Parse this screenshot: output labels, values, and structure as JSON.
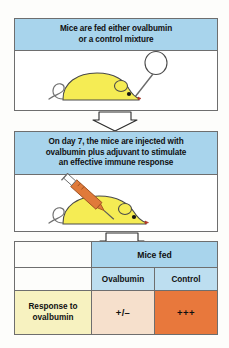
{
  "figure": {
    "colors": {
      "caption_blue": "#a8d4ec",
      "header_blue": "#bddef0",
      "row_label_yellow": "#f7f2c0",
      "treated_peach": "#f6e0cc",
      "control_orange": "#e8783c",
      "mouse_yellow": "#f5ec54",
      "syringe_orange": "#e07a3a",
      "outline": "#6e6e6e"
    }
  },
  "steps": [
    {
      "caption": "Mice are fed either ovalbumin or a control mixture",
      "caption_line1": "Mice are fed either ovalbumin",
      "caption_line2": "or a control mixture",
      "illustration": "mouse-being-fed-with-dropper"
    },
    {
      "caption": "On day 7, the mice are injected with ovalbumin plus adjuvant to stimulate an effective immune response",
      "caption_line1": "On day 7, the mice are injected with",
      "caption_line2": "ovalbumin plus adjuvant to stimulate",
      "caption_line3": "an effective immune response",
      "illustration": "mouse-being-injected-with-syringe"
    }
  ],
  "arrows": [
    {
      "name": "arrow-step1-to-step2",
      "direction": "down"
    },
    {
      "name": "arrow-step2-to-results",
      "direction": "down"
    }
  ],
  "results_table": {
    "group_header": "Mice fed",
    "column_headers": [
      "Ovalbumin",
      "Control"
    ],
    "rows": [
      {
        "label": "Response to ovalbumin",
        "label_line1": "Response to",
        "label_line2": "ovalbumin",
        "values": [
          "+/–",
          "+++"
        ]
      }
    ]
  }
}
